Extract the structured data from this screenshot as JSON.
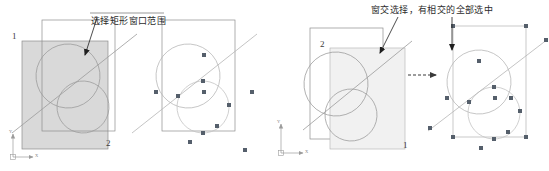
{
  "figure": {
    "title": "",
    "type": "cad-selection-illustration",
    "background": "#ffffff"
  },
  "colors": {
    "outline": "#8d8d8d",
    "shade_left": "#d9d9d9",
    "shade_right": "#f1f1f1",
    "curve": "#9a9a9a",
    "grip": "#555f6b",
    "text": "#2c2c2c",
    "leader": "#1f1f1f",
    "axis": "#9b9b9b"
  },
  "left_example": {
    "caption": "选择矩形窗口范围",
    "corner_label_start": "1",
    "corner_label_end": "2",
    "axis": {
      "x_label": "X",
      "y_label": "Y"
    },
    "before": {
      "selection_window": {
        "x": 22,
        "y": 41,
        "w": 86,
        "h": 108,
        "fill": "#d9d9d9"
      },
      "object_rect": {
        "x": 42,
        "y": 20,
        "w": 73,
        "h": 111
      },
      "circles": [
        {
          "cx": 68,
          "cy": 76,
          "rx": 32,
          "ry": 32,
          "rot": -18
        },
        {
          "cx": 83,
          "cy": 107,
          "rx": 26,
          "ry": 26,
          "rot": 15
        }
      ],
      "line": {
        "x1": 12,
        "y1": 133,
        "x2": 137,
        "y2": 34
      }
    },
    "after": {
      "object_rect": {
        "x": 162,
        "y": 20,
        "w": 73,
        "h": 111
      },
      "circles": [
        {
          "cx": 188,
          "cy": 76,
          "rx": 32,
          "ry": 32,
          "rot": -18
        },
        {
          "cx": 203,
          "cy": 107,
          "rx": 26,
          "ry": 26,
          "rot": 15
        }
      ],
      "line": {
        "x1": 132,
        "y1": 133,
        "x2": 257,
        "y2": 34
      },
      "grips": [
        {
          "x": 204,
          "y": 55
        },
        {
          "x": 156,
          "y": 92
        },
        {
          "x": 204,
          "y": 92
        },
        {
          "x": 252,
          "y": 92
        },
        {
          "x": 178,
          "y": 96
        },
        {
          "x": 229,
          "y": 105
        },
        {
          "x": 203,
          "y": 81
        },
        {
          "x": 217,
          "y": 126
        },
        {
          "x": 203,
          "y": 133
        },
        {
          "x": 190,
          "y": 142
        },
        {
          "x": 245,
          "y": 150
        }
      ]
    }
  },
  "right_example": {
    "caption": "窗交选择，有相交的全部选中",
    "corner_label_start": "2",
    "corner_label_end": "1",
    "axis": {
      "x_label": "X",
      "y_label": "Y"
    },
    "transition_arrow": "dashed-arrow-right",
    "before": {
      "selection_window": {
        "x": 330,
        "y": 48,
        "w": 75,
        "h": 101,
        "fill": "#f1f1f1"
      },
      "object_rect": {
        "x": 310,
        "y": 28,
        "w": 73,
        "h": 111
      },
      "circles": [
        {
          "cx": 336,
          "cy": 84,
          "rx": 32,
          "ry": 32,
          "rot": -18
        },
        {
          "cx": 351,
          "cy": 115,
          "rx": 26,
          "ry": 26,
          "rot": 15
        }
      ],
      "line": {
        "x1": 305,
        "y1": 128,
        "x2": 410,
        "y2": 42
      }
    },
    "after": {
      "object_rect": {
        "x": 453,
        "y": 26,
        "w": 73,
        "h": 111
      },
      "circles": [
        {
          "cx": 479,
          "cy": 82,
          "rx": 32,
          "ry": 32,
          "rot": -18
        },
        {
          "cx": 494,
          "cy": 113,
          "rx": 26,
          "ry": 26,
          "rot": 15
        }
      ],
      "line": {
        "x1": 428,
        "y1": 131,
        "x2": 548,
        "y2": 39
      },
      "grips": [
        {
          "x": 453,
          "y": 26
        },
        {
          "x": 526,
          "y": 26
        },
        {
          "x": 453,
          "y": 137
        },
        {
          "x": 526,
          "y": 137
        },
        {
          "x": 479,
          "y": 61
        },
        {
          "x": 447,
          "y": 98
        },
        {
          "x": 495,
          "y": 98
        },
        {
          "x": 511,
          "y": 98
        },
        {
          "x": 494,
          "y": 87
        },
        {
          "x": 469,
          "y": 102
        },
        {
          "x": 520,
          "y": 111
        },
        {
          "x": 508,
          "y": 132
        },
        {
          "x": 494,
          "y": 139
        },
        {
          "x": 481,
          "y": 148
        },
        {
          "x": 430,
          "y": 128
        },
        {
          "x": 546,
          "y": 40
        }
      ]
    }
  }
}
